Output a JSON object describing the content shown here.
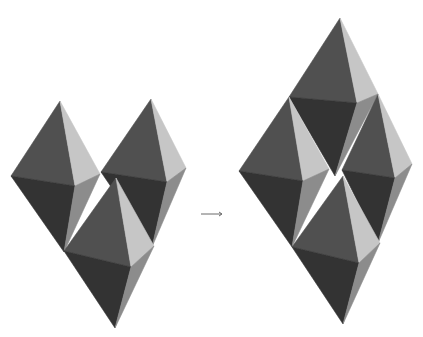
{
  "diagram": {
    "colors": {
      "background": "#ffffff",
      "face_upper_left": "#505050",
      "face_upper_right": "#c6c6c6",
      "face_lower_left": "#333333",
      "face_lower_right": "#8c8c8c",
      "arrow": "#444444"
    },
    "groups": [
      {
        "name": "before",
        "octahedra": [
          {
            "id": "oct-a",
            "T": [
              60,
              101
            ],
            "L": [
              11,
              176
            ],
            "F": [
              75,
              186
            ],
            "R": [
              100,
              174
            ],
            "B": [
              64,
              252
            ]
          },
          {
            "id": "oct-b",
            "T": [
              151,
              99
            ],
            "L": [
              101,
              172
            ],
            "F": [
              167,
              182
            ],
            "R": [
              186,
              168
            ],
            "B": [
              152,
              247
            ]
          },
          {
            "id": "oct-c",
            "T": [
              116,
              178
            ],
            "L": [
              64,
              251
            ],
            "F": [
              131,
              267
            ],
            "R": [
              154,
              246
            ],
            "B": [
              115,
              328
            ]
          }
        ]
      },
      {
        "name": "after",
        "octahedra": [
          {
            "id": "oct-d",
            "T": [
              340,
              18
            ],
            "L": [
              289,
              97
            ],
            "F": [
              357,
              103
            ],
            "R": [
              378,
              94
            ],
            "B": [
              335,
              176
            ]
          },
          {
            "id": "oct-e",
            "T": [
              289,
              97
            ],
            "L": [
              239,
              171
            ],
            "F": [
              303,
              181
            ],
            "R": [
              329,
              169
            ],
            "B": [
              292,
              247
            ]
          },
          {
            "id": "oct-f",
            "T": [
              378,
              94
            ],
            "L": [
              342,
              170
            ],
            "F": [
              395,
              178
            ],
            "R": [
              412,
              164
            ],
            "B": [
              378,
              243
            ]
          },
          {
            "id": "oct-g",
            "T": [
              343,
              176
            ],
            "L": [
              292,
              247
            ],
            "F": [
              359,
              263
            ],
            "R": [
              380,
              243
            ],
            "B": [
              343,
              324
            ]
          }
        ]
      }
    ],
    "arrow": {
      "from": [
        201,
        214
      ],
      "to": [
        222,
        214
      ],
      "glyph": "→"
    }
  }
}
